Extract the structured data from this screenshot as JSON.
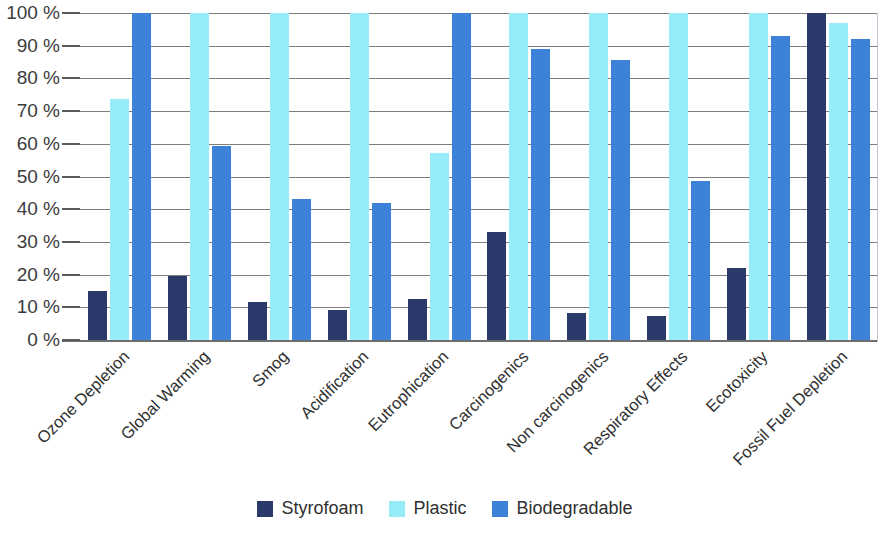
{
  "chart_data": {
    "type": "bar",
    "title": "",
    "subtitle": "",
    "xlabel": "",
    "ylabel": "",
    "ylim": [
      0,
      100
    ],
    "y_tick_labels": [
      "100 %",
      "90 %",
      "80 %",
      "70 %",
      "60 %",
      "50 %",
      "40 %",
      "30 %",
      "20 %",
      "10 %",
      "0 %"
    ],
    "y_tick_values": [
      100,
      90,
      80,
      70,
      60,
      50,
      40,
      30,
      20,
      10,
      0
    ],
    "grid": true,
    "legend_position": "bottom",
    "categories": [
      "Ozone Depletion",
      "Global Warming",
      "Smog",
      "Acidification",
      "Eutrophication",
      "Carcinogenics",
      "Non carcinogenics",
      "Respiratory Effects",
      "Ecotoxicity",
      "Fossil Fuel Depletion"
    ],
    "series": [
      {
        "name": "Styrofoam",
        "color": "#2b3a6b",
        "values": [
          15,
          19.5,
          11.5,
          9.3,
          12.5,
          33,
          8.3,
          7.2,
          22,
          100
        ]
      },
      {
        "name": "Plastic",
        "color": "#97ecf9",
        "values": [
          73.8,
          100,
          100,
          100,
          57.3,
          100,
          100,
          100,
          100,
          97
        ]
      },
      {
        "name": "Biodegradable",
        "color": "#3c82d8",
        "values": [
          100,
          59.3,
          43,
          41.8,
          100,
          89,
          85.5,
          48.5,
          93,
          92
        ]
      }
    ]
  }
}
